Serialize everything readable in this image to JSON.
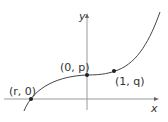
{
  "diagram": {
    "type": "function-graph",
    "axes": {
      "x_label": "x",
      "y_label": "y",
      "axis_color": "#999999",
      "curve_color": "#444444"
    },
    "points": [
      {
        "label": "(r, 0)",
        "desc": "x-intercept"
      },
      {
        "label": "(0, p)",
        "desc": "y-intercept"
      },
      {
        "label": "(1, q)",
        "desc": "point on curve"
      }
    ]
  }
}
